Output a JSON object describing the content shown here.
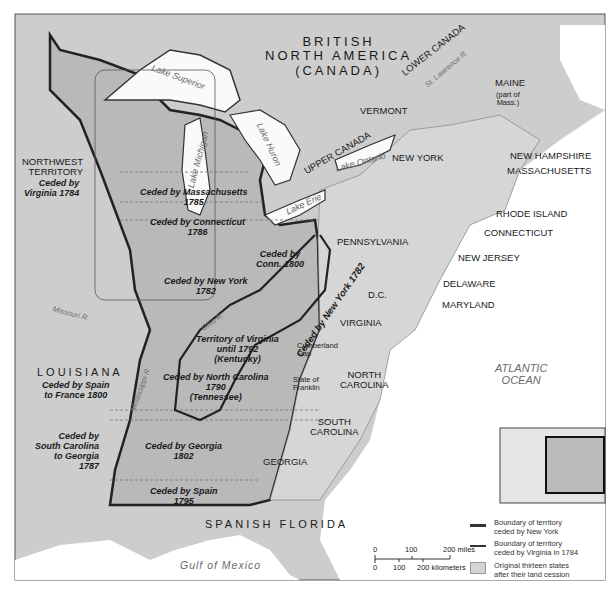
{
  "map": {
    "title_region": {
      "line1": "BRITISH",
      "line2": "NORTH AMERICA",
      "line3": "(CANADA)"
    },
    "regions": {
      "lower_canada": "LOWER CANADA",
      "upper_canada": "UPPER CANADA",
      "maine": "MAINE",
      "maine_note1": "(part of",
      "maine_note2": "Mass.)",
      "vermont": "VERMONT",
      "new_york": "NEW YORK",
      "new_hampshire": "NEW HAMPSHIRE",
      "massachusetts": "MASSACHUSETTS",
      "rhode_island": "RHODE ISLAND",
      "connecticut": "CONNECTICUT",
      "new_jersey": "NEW JERSEY",
      "pennsylvania": "PENNSYLVANIA",
      "delaware": "DELAWARE",
      "maryland": "MARYLAND",
      "dc": "D.C.",
      "virginia": "VIRGINIA",
      "north_carolina1": "NORTH",
      "north_carolina2": "CAROLINA",
      "south_carolina1": "SOUTH",
      "south_carolina2": "CAROLINA",
      "georgia": "GEORGIA",
      "spanish_florida": "SPANISH FLORIDA",
      "louisiana": "LOUISIANA",
      "louisiana_note1": "Ceded by Spain",
      "louisiana_note2": "to France 1800",
      "northwest1": "NORTHWEST",
      "northwest2": "TERRITORY",
      "northwest_note1": "Ceded by",
      "northwest_note2": "Virginia 1784",
      "cumberland1": "Cumberland",
      "cumberland2": "Gap",
      "franklin1": "State of",
      "franklin2": "Franklin"
    },
    "cessions": {
      "massachusetts": {
        "line1": "Ceded by Massachusetts",
        "line2": "1785"
      },
      "connecticut": {
        "line1": "Ceded by Connecticut",
        "line2": "1786"
      },
      "conn1800": {
        "line1": "Ceded by",
        "line2": "Conn. 1800"
      },
      "new_york": {
        "line1": "Ceded by New York",
        "line2": "1782"
      },
      "new_york_boundary": "Ceded by New York 1782",
      "virginia": {
        "line1": "Territory of Virginia",
        "line2": "until 1792",
        "line3": "(Kentucky)"
      },
      "north_carolina": {
        "line1": "Ceded by North Carolina",
        "line2": "1790",
        "line3": "(Tennessee)"
      },
      "south_carolina": {
        "line1": "Ceded by",
        "line2": "South Carolina",
        "line3": "to Georgia",
        "line4": "1787"
      },
      "georgia": {
        "line1": "Ceded by Georgia",
        "line2": "1802"
      },
      "spain": {
        "line1": "Ceded by Spain",
        "line2": "1795"
      }
    },
    "water": {
      "lake_superior": "Lake Superior",
      "lake_michigan": "Lake Michigan",
      "lake_huron": "Lake Huron",
      "lake_erie": "Lake Erie",
      "lake_ontario": "Lake Ontario",
      "st_lawrence": "St. Lawrence R.",
      "missouri": "Missouri R.",
      "ohio": "Ohio R.",
      "mississippi": "Mississippi R.",
      "atlantic1": "ATLANTIC",
      "atlantic2": "OCEAN",
      "gulf": "Gulf of Mexico"
    },
    "scale": {
      "miles_ticks": [
        "0",
        "100",
        "200 miles"
      ],
      "km_ticks": [
        "0",
        "100",
        "200 kilometers"
      ]
    },
    "legend": {
      "items": [
        {
          "label1": "Boundary of territory",
          "label2": "ceded by New York",
          "type": "line",
          "color": "#333333"
        },
        {
          "label1": "Boundary of territory",
          "label2": "ceded by Virginia in 1784",
          "type": "line",
          "color": "#444444"
        },
        {
          "label1": "Original thirteen states",
          "label2": "after their land cession",
          "type": "box",
          "color": "#d4d4d4"
        }
      ]
    },
    "colors": {
      "land": "#cfcfcf",
      "ceded_land": "#b8b8b8",
      "original_states": "#d9d9d9",
      "water": "#ffffff",
      "border_dark": "#2a2a2a"
    }
  }
}
